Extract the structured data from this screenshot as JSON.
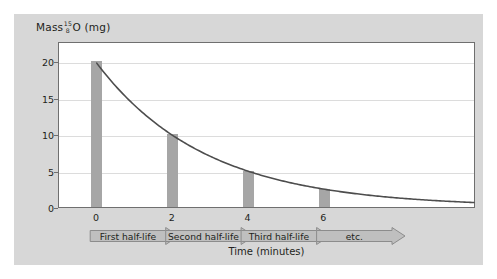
{
  "chart_data": {
    "type": "bar",
    "title": "",
    "xlabel": "Time (minutes)",
    "ylabel": "Mass O-15 (mg)",
    "ylabel_parts": {
      "prefix": "Mass",
      "mass_number": "15",
      "atomic_number": "8",
      "element": "O",
      "unit": "(mg)"
    },
    "x": [
      0,
      2,
      4,
      6
    ],
    "categories": [
      "0",
      "2",
      "4",
      "6"
    ],
    "values": [
      20,
      10,
      5,
      2.5
    ],
    "bar_series_name": "Mass of oxygen-15 remaining",
    "xlim": [
      -1,
      10
    ],
    "ylim": [
      0,
      22.8
    ],
    "xticks": [
      "0",
      "2",
      "4",
      "6"
    ],
    "xtick_values": [
      0,
      2,
      4,
      6
    ],
    "yticks": [
      "0",
      "5",
      "10",
      "15",
      "20"
    ],
    "ytick_values": [
      0,
      5,
      10,
      15,
      20
    ],
    "grid": "horizontal",
    "legend": "none",
    "curve": {
      "name": "exponential decay",
      "initial_value": 20,
      "half_life": 2,
      "half_life_unit": "minutes",
      "equation": "m = 20 * (1/2)^(t/2)",
      "points": [
        {
          "t": 0,
          "m": 20
        },
        {
          "t": 1,
          "m": 14.14
        },
        {
          "t": 2,
          "m": 10
        },
        {
          "t": 3,
          "m": 7.07
        },
        {
          "t": 4,
          "m": 5
        },
        {
          "t": 5,
          "m": 3.54
        },
        {
          "t": 6,
          "m": 2.5
        },
        {
          "t": 7,
          "m": 1.77
        },
        {
          "t": 8,
          "m": 1.25
        },
        {
          "t": 9,
          "m": 0.88
        },
        {
          "t": 10,
          "m": 0.63
        }
      ]
    },
    "annotations": [
      {
        "label": "First half-life",
        "from": 0,
        "to": 2
      },
      {
        "label": "Second half-life",
        "from": 2,
        "to": 4
      },
      {
        "label": "Third half-life",
        "from": 4,
        "to": 6
      },
      {
        "label": "etc.",
        "from": 6,
        "to": 8
      }
    ],
    "colors": {
      "panel_background": "#d7d7d7",
      "plot_background": "#ffffff",
      "bar": "#a6a6a6",
      "curve": "#4d4d4d",
      "gridline": "#dcdcdc",
      "frame": "#6f6f6f",
      "arrow_fill": "#bfbfbf",
      "arrow_stroke": "#8c8c8c",
      "text": "#231f20"
    }
  }
}
